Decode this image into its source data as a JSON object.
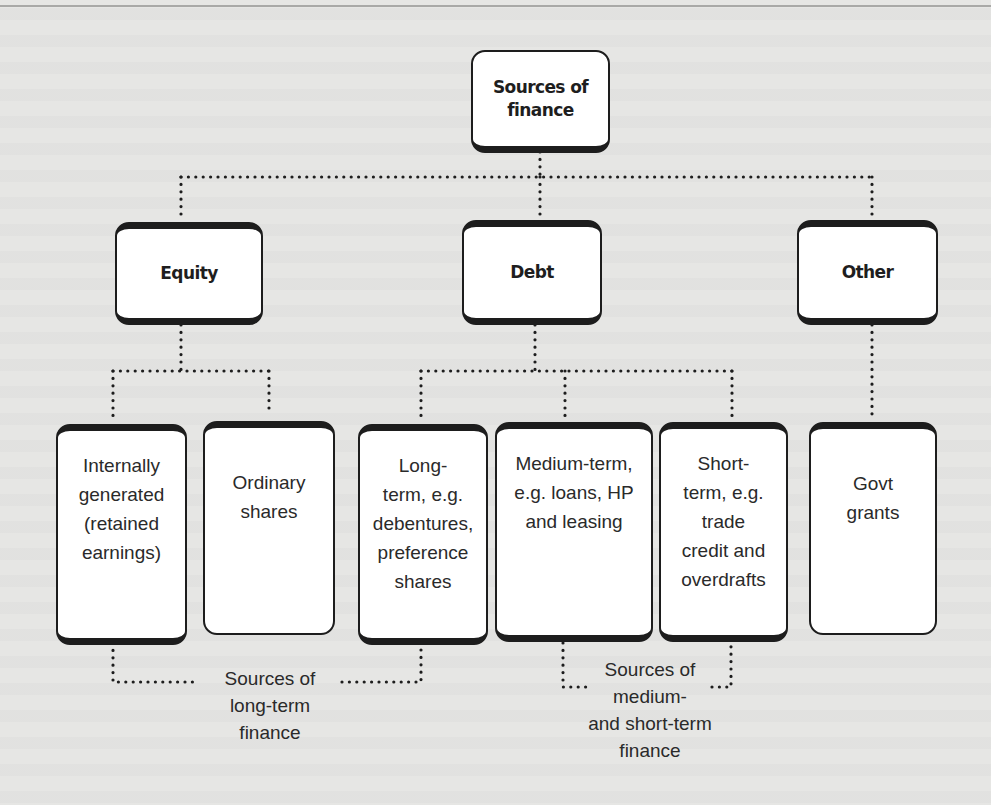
{
  "diagram": {
    "root": {
      "label": "Sources of\nfinance"
    },
    "categories": [
      {
        "id": "equity",
        "label": "Equity"
      },
      {
        "id": "debt",
        "label": "Debt"
      },
      {
        "id": "other",
        "label": "Other"
      }
    ],
    "leaves": [
      {
        "parent": "equity",
        "label": "Internally\ngenerated\n(retained\nearnings)"
      },
      {
        "parent": "equity",
        "label": "Ordinary\nshares"
      },
      {
        "parent": "debt",
        "label": "Long-\nterm, e.g.\ndebentures,\npreference\nshares"
      },
      {
        "parent": "debt",
        "label": "Medium-term,\ne.g. loans, HP\nand leasing"
      },
      {
        "parent": "debt",
        "label": "Short-\nterm, e.g.\ntrade\ncredit and\noverdrafts"
      },
      {
        "parent": "other",
        "label": "Govt\ngrants"
      }
    ],
    "groups": [
      {
        "label": "Sources of\nlong-term\nfinance"
      },
      {
        "label": "Sources of\nmedium-\nand short-term\nfinance"
      }
    ]
  },
  "colors": {
    "background": "#e6e6e4",
    "box_fill": "#ffffff",
    "box_border": "#1d1d1d",
    "connector": "#1d1d1d"
  }
}
